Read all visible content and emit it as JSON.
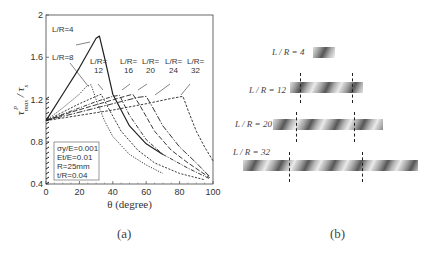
{
  "panel_a": {
    "caption": "(a)",
    "xlabel": "θ (degree)",
    "ylabel": "τ_max^p / τ_s",
    "legend_box": [
      "σy/E=0.001",
      "Et/E=0.01",
      "R=25mm",
      "t/R=0.04"
    ],
    "curve_labels": [
      {
        "line1": "L/R=4",
        "line2": ""
      },
      {
        "line1": "L/R=8",
        "line2": ""
      },
      {
        "line1": "L/R=",
        "line2": "12"
      },
      {
        "line1": "L/R=",
        "line2": "16"
      },
      {
        "line1": "L/R=",
        "line2": "20"
      },
      {
        "line1": "L/R=",
        "line2": "24"
      },
      {
        "line1": "L/R=",
        "line2": "32"
      }
    ]
  },
  "panel_b": {
    "caption": "(b)",
    "labels": [
      "L / R = 4",
      "L / R = 12",
      "L / R = 20",
      "L / R = 32"
    ]
  },
  "chart_data": {
    "type": "line",
    "title": "",
    "xlabel": "θ (degree)",
    "ylabel": "τ_max^p / τ_s",
    "xlim": [
      0,
      100
    ],
    "ylim": [
      0.4,
      2.0
    ],
    "xticks": [
      0,
      20,
      40,
      60,
      80,
      100
    ],
    "yticks": [
      0.4,
      0.8,
      1.2,
      1.6,
      2.0
    ],
    "grid": false,
    "annotation": "σy/E=0.001, Et/E=0.01, R=25mm, t/R=0.04",
    "series": [
      {
        "name": "L/R=4",
        "x": [
          0,
          2,
          10,
          20,
          30,
          32,
          35,
          40,
          50,
          60,
          70
        ],
        "y": [
          1.0,
          1.05,
          1.25,
          1.5,
          1.78,
          1.8,
          1.6,
          1.25,
          0.95,
          0.78,
          0.68
        ]
      },
      {
        "name": "L/R=8",
        "x": [
          0,
          10,
          20,
          24,
          27,
          30,
          35,
          40,
          50,
          60,
          70
        ],
        "y": [
          1.0,
          1.12,
          1.25,
          1.32,
          1.34,
          1.2,
          1.0,
          0.85,
          0.68,
          0.58,
          0.5
        ]
      },
      {
        "name": "L/R=12",
        "x": [
          0,
          10,
          20,
          30,
          33,
          38,
          45,
          55,
          65,
          80,
          95
        ],
        "y": [
          1.0,
          1.08,
          1.16,
          1.23,
          1.25,
          1.1,
          0.9,
          0.72,
          0.6,
          0.5,
          0.44
        ]
      },
      {
        "name": "L/R=16",
        "x": [
          0,
          10,
          20,
          30,
          40,
          44,
          50,
          60,
          70,
          85,
          98
        ],
        "y": [
          1.0,
          1.06,
          1.12,
          1.18,
          1.23,
          1.24,
          1.05,
          0.82,
          0.68,
          0.55,
          0.45
        ]
      },
      {
        "name": "L/R=20",
        "x": [
          0,
          15,
          30,
          45,
          52,
          56,
          65,
          75,
          85,
          98
        ],
        "y": [
          1.0,
          1.08,
          1.15,
          1.22,
          1.25,
          1.15,
          0.9,
          0.72,
          0.6,
          0.46
        ]
      },
      {
        "name": "L/R=24",
        "x": [
          0,
          15,
          30,
          45,
          55,
          60,
          63,
          70,
          80,
          90,
          98
        ],
        "y": [
          1.0,
          1.06,
          1.12,
          1.18,
          1.22,
          1.23,
          1.15,
          0.95,
          0.75,
          0.6,
          0.47
        ]
      },
      {
        "name": "L/R=32",
        "x": [
          0,
          20,
          40,
          60,
          75,
          82,
          85,
          90,
          95,
          100
        ],
        "y": [
          1.0,
          1.05,
          1.1,
          1.16,
          1.21,
          1.23,
          1.1,
          0.9,
          0.75,
          0.62
        ]
      }
    ]
  }
}
